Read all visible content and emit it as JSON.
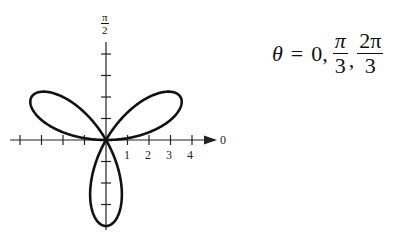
{
  "chart_data": {
    "type": "line",
    "subtype": "polar-rose",
    "title": "",
    "equation_hint": "r = 4 sin 3θ (three-petal rose)",
    "petal_count": 3,
    "max_radius": 4,
    "petal_directions_deg": [
      30,
      150,
      270
    ],
    "polar_axis": {
      "label": "0",
      "tick_labels": [
        "1",
        "2",
        "3",
        "4"
      ],
      "ticks_left": 4,
      "arrow": true
    },
    "vertical_axis": {
      "label_num": "π",
      "label_den": "2",
      "ticks_up": 4,
      "ticks_down": 4
    },
    "grid": false,
    "annotations": [
      {
        "text": "θ = 0, π/3, 2π/3"
      }
    ]
  },
  "equation": {
    "theta": "θ",
    "equals": "=",
    "zero": "0,",
    "f1_num": "π",
    "f1_den": "3",
    "comma": ",",
    "f2_num": "2π",
    "f2_den": "3"
  },
  "axis_labels": {
    "zero": "0",
    "t1": "1",
    "t2": "2",
    "t3": "3",
    "t4": "4",
    "pi": "π",
    "two": "2"
  },
  "colors": {
    "curve": "#111111",
    "axis": "#222222",
    "background": "#ffffff"
  }
}
